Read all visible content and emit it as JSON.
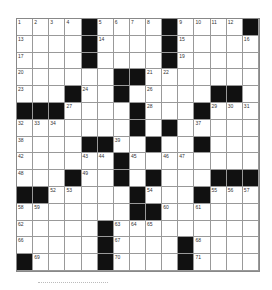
{
  "puzzle": {
    "rows": 15,
    "cols": 15,
    "grid": [
      ".....#....#....#",
      "x"
    ],
    "layout": [
      "....#....#....#",
      "....#....#.....",
      "....#....#.....",
      "......##.......",
      "...#..#.....##.",
      "###....#...#...",
      ".......#.#.....",
      "....##..#..#...",
      "......#........",
      "...#..#.#...###",
      "##.....#...#...",
      ".......##......",
      ".....#.........",
      ".....#....#....",
      "#....#....#...."
    ],
    "numbers": [
      [
        0,
        0,
        1
      ],
      [
        0,
        1,
        2
      ],
      [
        0,
        2,
        3
      ],
      [
        0,
        3,
        4
      ],
      [
        0,
        5,
        5
      ],
      [
        0,
        6,
        6
      ],
      [
        0,
        7,
        7
      ],
      [
        0,
        8,
        8
      ],
      [
        0,
        10,
        9
      ],
      [
        0,
        11,
        10
      ],
      [
        0,
        12,
        11
      ],
      [
        0,
        13,
        12
      ],
      [
        1,
        0,
        13
      ],
      [
        1,
        5,
        14
      ],
      [
        1,
        10,
        15
      ],
      [
        1,
        14,
        16
      ],
      [
        2,
        0,
        17
      ],
      [
        2,
        4,
        18
      ],
      [
        2,
        10,
        19
      ],
      [
        3,
        0,
        20
      ],
      [
        3,
        8,
        21
      ],
      [
        3,
        9,
        22
      ],
      [
        4,
        0,
        23
      ],
      [
        4,
        4,
        24
      ],
      [
        4,
        6,
        25
      ],
      [
        4,
        8,
        26
      ],
      [
        5,
        3,
        27
      ],
      [
        5,
        8,
        28
      ],
      [
        5,
        12,
        29
      ],
      [
        5,
        13,
        30
      ],
      [
        5,
        14,
        31
      ],
      [
        6,
        0,
        32
      ],
      [
        6,
        1,
        33
      ],
      [
        6,
        2,
        34
      ],
      [
        6,
        7,
        35
      ],
      [
        6,
        9,
        36
      ],
      [
        6,
        11,
        37
      ],
      [
        7,
        0,
        38
      ],
      [
        7,
        6,
        39
      ],
      [
        7,
        8,
        40
      ],
      [
        7,
        11,
        41
      ],
      [
        8,
        0,
        42
      ],
      [
        8,
        4,
        43
      ],
      [
        8,
        5,
        44
      ],
      [
        8,
        7,
        45
      ],
      [
        8,
        9,
        46
      ],
      [
        8,
        10,
        47
      ],
      [
        9,
        0,
        48
      ],
      [
        9,
        4,
        49
      ],
      [
        9,
        6,
        50
      ],
      [
        9,
        8,
        51
      ],
      [
        10,
        2,
        52
      ],
      [
        10,
        3,
        53
      ],
      [
        10,
        8,
        54
      ],
      [
        10,
        12,
        55
      ],
      [
        10,
        13,
        56
      ],
      [
        10,
        14,
        57
      ],
      [
        11,
        0,
        58
      ],
      [
        11,
        1,
        59
      ],
      [
        11,
        9,
        60
      ],
      [
        11,
        11,
        61
      ],
      [
        12,
        0,
        62
      ],
      [
        12,
        6,
        63
      ],
      [
        12,
        7,
        64
      ],
      [
        12,
        8,
        65
      ],
      [
        13,
        0,
        66
      ],
      [
        13,
        6,
        67
      ],
      [
        13,
        11,
        68
      ],
      [
        14,
        1,
        69
      ],
      [
        14,
        6,
        70
      ],
      [
        14,
        11,
        71
      ]
    ]
  }
}
